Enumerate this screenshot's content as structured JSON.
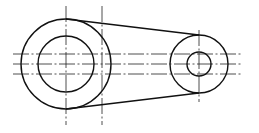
{
  "colors": {
    "background": "#ffffff",
    "outline": "#111111",
    "centerline": "#222222"
  },
  "drawing": {
    "large_boss": {
      "cx": 66,
      "cy": 64,
      "outer_r": 45,
      "inner_r": 28
    },
    "small_boss": {
      "cx": 199,
      "cy": 64,
      "outer_r": 29,
      "inner_r": 12
    },
    "upper_tangent": {
      "x1": 66,
      "y1": 19,
      "x2": 199,
      "y2": 35
    },
    "lower_tangent": {
      "x1": 66,
      "y1": 109,
      "x2": 199,
      "y2": 93
    },
    "horizontal_centerlines_y": [
      54,
      64,
      74
    ],
    "horizontal_centerline_x_range": [
      13,
      243
    ],
    "vertical_centerlines": [
      {
        "x": 66,
        "y1": 6,
        "y2": 125
      },
      {
        "x": 102,
        "y1": 6,
        "y2": 125
      },
      {
        "x": 199,
        "y1": 30,
        "y2": 102
      }
    ]
  }
}
